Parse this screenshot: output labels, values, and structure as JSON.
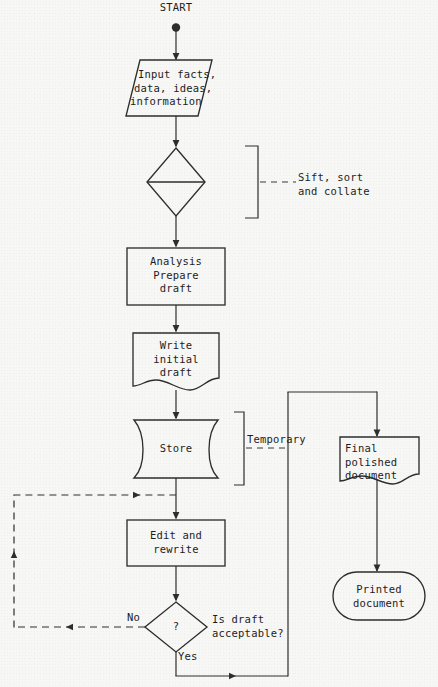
{
  "diagram": {
    "type": "flowchart",
    "start_label": "START",
    "nodes": [
      {
        "id": "start",
        "label": "START",
        "shape": "terminator-dot"
      },
      {
        "id": "input",
        "label": "Input facts,\ndata, ideas,\ninformation",
        "shape": "parallelogram"
      },
      {
        "id": "sift",
        "label": "",
        "shape": "diamond-split"
      },
      {
        "id": "analysis",
        "label": "Analysis\nPrepare\ndraft",
        "shape": "rectangle"
      },
      {
        "id": "write",
        "label": "Write\ninitial\ndraft",
        "shape": "document"
      },
      {
        "id": "store",
        "label": "Store",
        "shape": "stored-data"
      },
      {
        "id": "edit",
        "label": "Edit and\nrewrite",
        "shape": "rectangle"
      },
      {
        "id": "decision",
        "label": "?",
        "shape": "diamond"
      },
      {
        "id": "final",
        "label": "Final\npolished\ndocument",
        "shape": "document"
      },
      {
        "id": "printed",
        "label": "Printed\ndocument",
        "shape": "rounded-rectangle"
      }
    ],
    "annotations": [
      {
        "id": "sift-note",
        "label": "Sift, sort\nand collate",
        "style": "bracket-dashed-leader"
      },
      {
        "id": "temporary-note",
        "label": "Temporary",
        "style": "bracket-dashed-leader"
      },
      {
        "id": "question-note",
        "label": "Is draft\nacceptable?",
        "style": "plain"
      }
    ],
    "edge_labels": {
      "no": "No",
      "yes": "Yes"
    },
    "node_text": {
      "input_line1": "Input facts,",
      "input_line2": "data, ideas,",
      "input_line3": "information",
      "analysis_line1": "Analysis",
      "analysis_line2": "Prepare",
      "analysis_line3": "draft",
      "write_line1": "Write",
      "write_line2": "initial",
      "write_line3": "draft",
      "store_line1": "Store",
      "edit_line1": "Edit and",
      "edit_line2": "rewrite",
      "decision_mark": "?",
      "final_line1": "Final",
      "final_line2": "polished",
      "final_line3": "document",
      "printed_line1": "Printed",
      "printed_line2": "document"
    },
    "annotation_text": {
      "sift_line1": "Sift, sort",
      "sift_line2": "and collate",
      "temporary_line1": "Temporary",
      "question_line1": "Is draft",
      "question_line2": "acceptable?"
    },
    "colors": {
      "page_background": "#f7f7f5",
      "stroke": "#2e2e2e",
      "text": "#1d1d1d"
    }
  }
}
